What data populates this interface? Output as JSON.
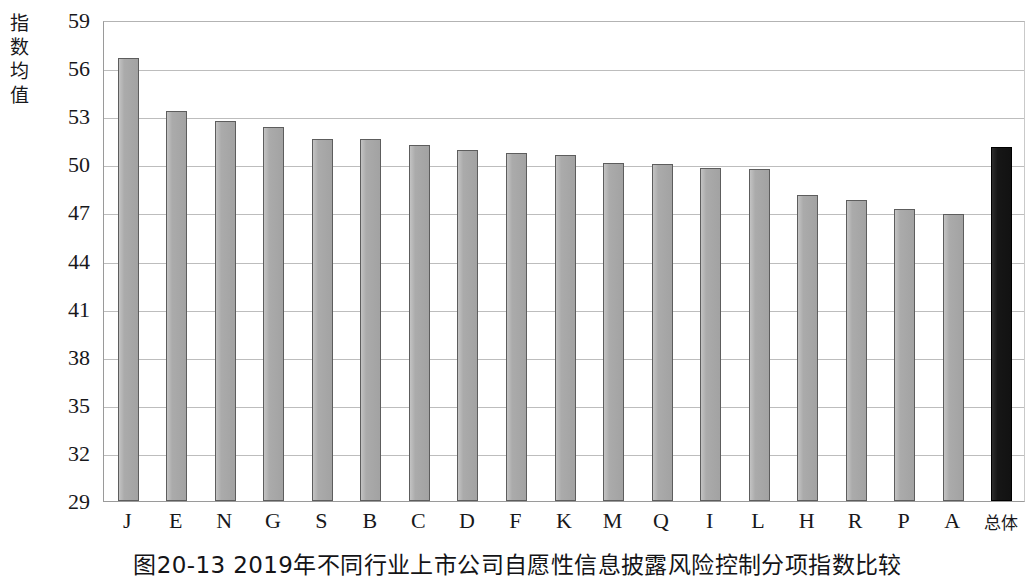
{
  "chart_data": {
    "type": "bar",
    "title": "图20-13  2019年不同行业上市公司自愿性信息披露风险控制分项指数比较",
    "xlabel": "",
    "ylabel": "指数均值",
    "ylim": [
      29,
      59
    ],
    "yticks": [
      29,
      32,
      35,
      38,
      41,
      44,
      47,
      50,
      53,
      56,
      59
    ],
    "grid": true,
    "legend": "none",
    "categories": [
      "J",
      "E",
      "N",
      "G",
      "S",
      "B",
      "C",
      "D",
      "F",
      "K",
      "M",
      "Q",
      "I",
      "L",
      "H",
      "R",
      "P",
      "A",
      "总体"
    ],
    "values": [
      56.6,
      53.3,
      52.7,
      52.3,
      51.6,
      51.6,
      51.2,
      50.9,
      50.7,
      50.6,
      50.1,
      50.0,
      49.8,
      49.7,
      48.1,
      47.8,
      47.2,
      46.9,
      51.1
    ],
    "bar_colors": [
      "#a9a9a9",
      "#a9a9a9",
      "#a9a9a9",
      "#a9a9a9",
      "#a9a9a9",
      "#a9a9a9",
      "#a9a9a9",
      "#a9a9a9",
      "#a9a9a9",
      "#a9a9a9",
      "#a9a9a9",
      "#a9a9a9",
      "#a9a9a9",
      "#a9a9a9",
      "#a9a9a9",
      "#a9a9a9",
      "#a9a9a9",
      "#a9a9a9",
      "#161616"
    ],
    "highlight_category": "总体",
    "highlight_color": "#161616",
    "series_color": "#a9a9a9",
    "gridline_color": "#bdbdbd",
    "axis_color": "#9a9a9a"
  }
}
